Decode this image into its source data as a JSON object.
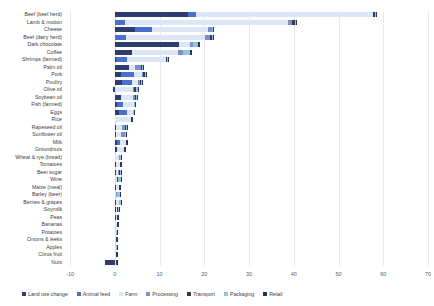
{
  "chart_data": {
    "type": "bar",
    "subtype": "stacked-horizontal-bar",
    "title": "",
    "xlabel": "",
    "ylabel": "",
    "xlim": [
      -10,
      70
    ],
    "xticks": [
      -10,
      0,
      10,
      20,
      30,
      40,
      50,
      60,
      70
    ],
    "grid": true,
    "legend_position": "bottom",
    "orientation": "horizontal",
    "series": [
      {
        "name": "Land use change",
        "color": "#2e3c70"
      },
      {
        "name": "Animal feed",
        "color": "#4a6fd1"
      },
      {
        "name": "Farm",
        "color": "#dbe7f7"
      },
      {
        "name": "Processing",
        "color": "#7d8fc4"
      },
      {
        "name": "Transport",
        "color": "#353a55"
      },
      {
        "name": "Packaging",
        "color": "#8fc8d4"
      },
      {
        "name": "Retail",
        "color": "#2a3457"
      }
    ],
    "categories": [
      "Beef (beef herd)",
      "Lamb & mutton",
      "Cheese",
      "Beef (dairy herd)",
      "Dark chocolate",
      "Coffee",
      "Shrimps (farmed)",
      "Palm oil",
      "Pork",
      "Poultry",
      "Olive oil",
      "Soybean oil",
      "Fish (farmed)",
      "Eggs",
      "Rice",
      "Rapeseed oil",
      "Sunflower oil",
      "Milk",
      "Groundnuts",
      "Wheat & rye (bread)",
      "Tomatoes",
      "Beet sugar",
      "Wine",
      "Maize (meal)",
      "Barley (beer)",
      "Berries & grapes",
      "Soymilk",
      "Peas",
      "Bananas",
      "Potatoes",
      "Onions & leeks",
      "Apples",
      "Citrus fruit",
      "Nuts"
    ],
    "values": [
      [
        16.3,
        1.9,
        39.4,
        0.2,
        0.3,
        0.2,
        0.2
      ],
      [
        0.0,
        2.4,
        36.4,
        0.9,
        0.5,
        0.3,
        0.2
      ],
      [
        4.5,
        3.8,
        12.6,
        0.8,
        0.1,
        0.2,
        0.2
      ],
      [
        0.0,
        2.5,
        17.7,
        1.1,
        0.4,
        0.3,
        0.2
      ],
      [
        14.3,
        0.0,
        2.6,
        0.5,
        0.1,
        1.2,
        0.3
      ],
      [
        3.8,
        0.0,
        10.4,
        1.0,
        0.1,
        1.6,
        0.3
      ],
      [
        0.2,
        2.5,
        8.8,
        0.0,
        0.1,
        0.3,
        0.2
      ],
      [
        3.1,
        0.0,
        1.5,
        1.2,
        0.3,
        0.2,
        0.2
      ],
      [
        1.5,
        2.9,
        1.7,
        0.3,
        0.3,
        0.2,
        0.2
      ],
      [
        1.6,
        2.3,
        1.3,
        0.4,
        0.3,
        0.2,
        0.2
      ],
      [
        -0.4,
        0.0,
        4.1,
        0.3,
        0.3,
        0.4,
        0.2
      ],
      [
        1.5,
        0.0,
        2.5,
        0.6,
        0.2,
        0.2,
        0.2
      ],
      [
        0.5,
        1.3,
        2.5,
        0.0,
        0.1,
        0.2,
        0.2
      ],
      [
        1.0,
        1.7,
        1.3,
        0.0,
        0.1,
        0.3,
        0.2
      ],
      [
        0.0,
        0.0,
        3.6,
        0.1,
        0.1,
        0.1,
        0.1
      ],
      [
        0.2,
        0.0,
        1.4,
        0.8,
        0.2,
        0.2,
        0.2
      ],
      [
        0.2,
        0.0,
        1.2,
        0.8,
        0.2,
        0.2,
        0.2
      ],
      [
        0.5,
        0.6,
        1.4,
        0.1,
        0.1,
        0.1,
        0.1
      ],
      [
        0.4,
        0.0,
        1.6,
        0.1,
        0.1,
        0.2,
        0.1
      ],
      [
        0.1,
        0.0,
        0.8,
        0.2,
        0.1,
        0.1,
        0.1
      ],
      [
        0.2,
        0.0,
        1.0,
        0.0,
        0.2,
        0.1,
        0.1
      ],
      [
        0.2,
        0.0,
        0.5,
        0.3,
        0.1,
        0.4,
        0.1
      ],
      [
        0.1,
        0.0,
        0.4,
        0.1,
        0.1,
        0.7,
        0.1
      ],
      [
        0.3,
        0.0,
        0.6,
        0.1,
        0.1,
        0.1,
        0.1
      ],
      [
        0.0,
        0.0,
        0.2,
        0.3,
        0.1,
        0.5,
        0.1
      ],
      [
        0.2,
        0.0,
        0.7,
        0.0,
        0.1,
        0.3,
        0.1
      ],
      [
        0.2,
        0.0,
        0.2,
        0.2,
        0.1,
        0.2,
        0.1
      ],
      [
        0.2,
        0.0,
        0.4,
        0.0,
        0.1,
        0.1,
        0.1
      ],
      [
        0.1,
        0.0,
        0.3,
        0.0,
        0.3,
        0.1,
        0.1
      ],
      [
        0.0,
        0.0,
        0.2,
        0.0,
        0.1,
        0.1,
        0.1
      ],
      [
        0.1,
        0.0,
        0.2,
        0.0,
        0.1,
        0.1,
        0.1
      ],
      [
        0.0,
        0.0,
        0.2,
        0.0,
        0.1,
        0.1,
        0.1
      ],
      [
        0.1,
        0.0,
        0.2,
        0.0,
        0.1,
        0.1,
        0.1
      ],
      [
        -2.1,
        0.0,
        0.2,
        0.1,
        0.1,
        0.1,
        0.1
      ]
    ]
  }
}
